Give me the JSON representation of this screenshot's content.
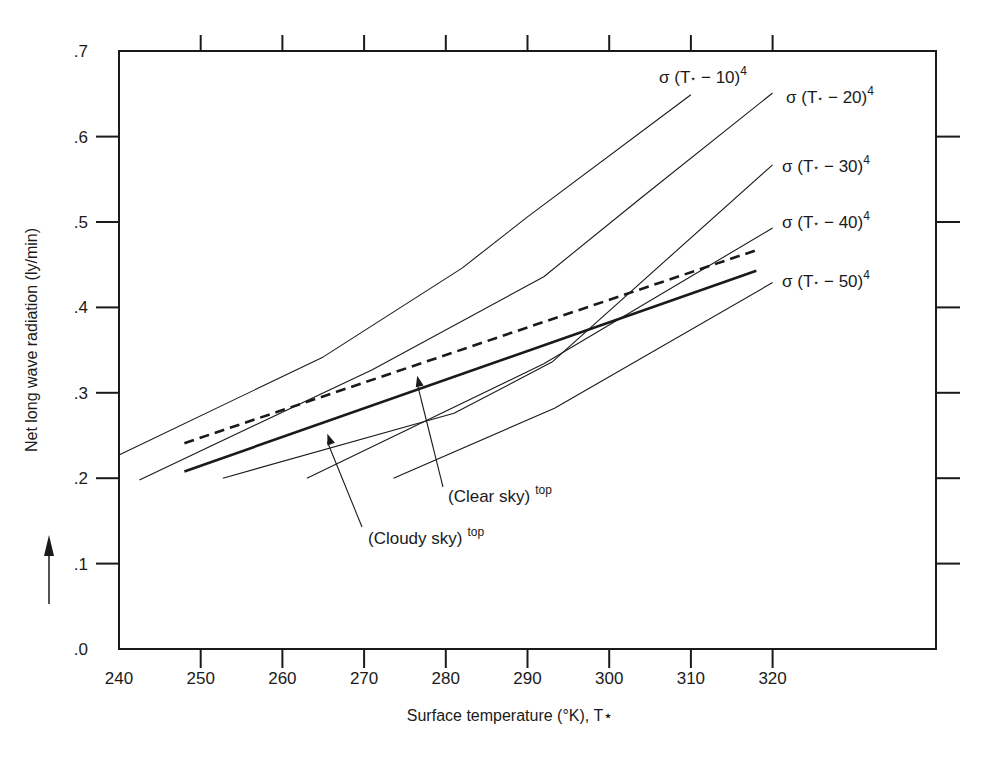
{
  "chart_data": {
    "type": "line",
    "title": "",
    "xlabel": "Surface temperature (°K), T⋆",
    "ylabel": "Net long wave radiation (ly/min)",
    "xlim": [
      240,
      340
    ],
    "ylim": [
      0.0,
      0.7
    ],
    "x_ticks": [
      240,
      250,
      260,
      270,
      280,
      290,
      300,
      310,
      320
    ],
    "x_tick_labels": [
      "240",
      "250",
      "260",
      "270",
      "280",
      "290",
      "300",
      "310",
      "320"
    ],
    "y_ticks": [
      0.0,
      0.1,
      0.2,
      0.3,
      0.4,
      0.5,
      0.6,
      0.7
    ],
    "y_tick_labels": [
      ".0",
      ".1",
      ".2",
      ".3",
      ".4",
      ".5",
      ".6",
      ".7"
    ],
    "grid": false,
    "legend": "inline labels at line ends",
    "series": [
      {
        "name": "σ (T⋆ − 10)⁴",
        "label_main": "σ (T",
        "label_delta": "− 10)",
        "style": "thin",
        "x": [
          240,
          265,
          282,
          290,
          310
        ],
        "y": [
          0.227,
          0.342,
          0.446,
          0.506,
          0.649
        ]
      },
      {
        "name": "σ (T⋆ − 20)⁴",
        "label_main": "σ (T",
        "label_delta": "− 20)",
        "style": "thin",
        "x": [
          242.5,
          271,
          292,
          304,
          320
        ],
        "y": [
          0.198,
          0.327,
          0.436,
          0.529,
          0.651
        ]
      },
      {
        "name": "σ (T⋆ − 30)⁴",
        "label_main": "σ (T",
        "label_delta": "− 30)",
        "style": "thin",
        "x": [
          252.7,
          281,
          293,
          320
        ],
        "y": [
          0.2,
          0.276,
          0.336,
          0.567
        ]
      },
      {
        "name": "σ (T⋆ − 40)⁴",
        "label_main": "σ (T",
        "label_delta": "− 40)",
        "style": "thin",
        "x": [
          263,
          292,
          320
        ],
        "y": [
          0.2,
          0.334,
          0.493
        ]
      },
      {
        "name": "σ (T⋆ − 50)⁴",
        "label_main": "σ (T",
        "label_delta": "− 50)",
        "style": "thin",
        "x": [
          273.6,
          293.3,
          320
        ],
        "y": [
          0.2,
          0.282,
          0.429
        ]
      },
      {
        "name": "(Clear sky) top",
        "style": "dashed",
        "x": [
          248,
          318
        ],
        "y": [
          0.241,
          0.467
        ]
      },
      {
        "name": "(Cloudy sky) top",
        "style": "thick",
        "x": [
          248,
          318
        ],
        "y": [
          0.208,
          0.443
        ]
      }
    ],
    "annotations": [
      {
        "text": "(Clear sky)",
        "sup": "top",
        "arrow_to": [
          276.5,
          0.32
        ]
      },
      {
        "text": "(Cloudy  sky)",
        "sup": "top",
        "arrow_to": [
          265.5,
          0.252
        ]
      }
    ],
    "exponent": "4",
    "star": "⋆"
  },
  "colors": {
    "ink": "#1a1a1a",
    "background": "#ffffff"
  }
}
